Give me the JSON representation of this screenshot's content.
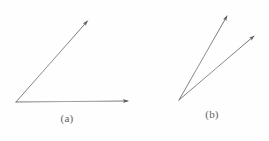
{
  "figure": {
    "width": 269,
    "height": 141,
    "background_color": "#fefefe",
    "stroke_color": "#6e6e78",
    "label_color": "#5f5f68",
    "stroke_width": 0.9
  },
  "panels": [
    {
      "id": "a",
      "label": "(a)",
      "label_x": 67,
      "label_y": 118,
      "vertex": {
        "x": 16,
        "y": 102
      },
      "rays": [
        {
          "name": "horizontal-ray",
          "tip_x": 131,
          "tip_y": 101,
          "angle_deg": 0.5,
          "has_arrowhead": true
        },
        {
          "name": "diagonal-ray",
          "tip_x": 89,
          "tip_y": 19,
          "angle_deg": 48.5,
          "has_arrowhead": true
        }
      ],
      "interior_angle_deg": 48
    },
    {
      "id": "b",
      "label": "(b)",
      "label_x": 212,
      "label_y": 114,
      "vertex": {
        "x": 179,
        "y": 100
      },
      "rays": [
        {
          "name": "steep-ray",
          "tip_x": 229,
          "tip_y": 13,
          "angle_deg": 60.1,
          "has_arrowhead": true
        },
        {
          "name": "shallow-ray",
          "tip_x": 257,
          "tip_y": 33,
          "angle_deg": 40.6,
          "has_arrowhead": true
        }
      ],
      "interior_angle_deg": 20
    }
  ]
}
